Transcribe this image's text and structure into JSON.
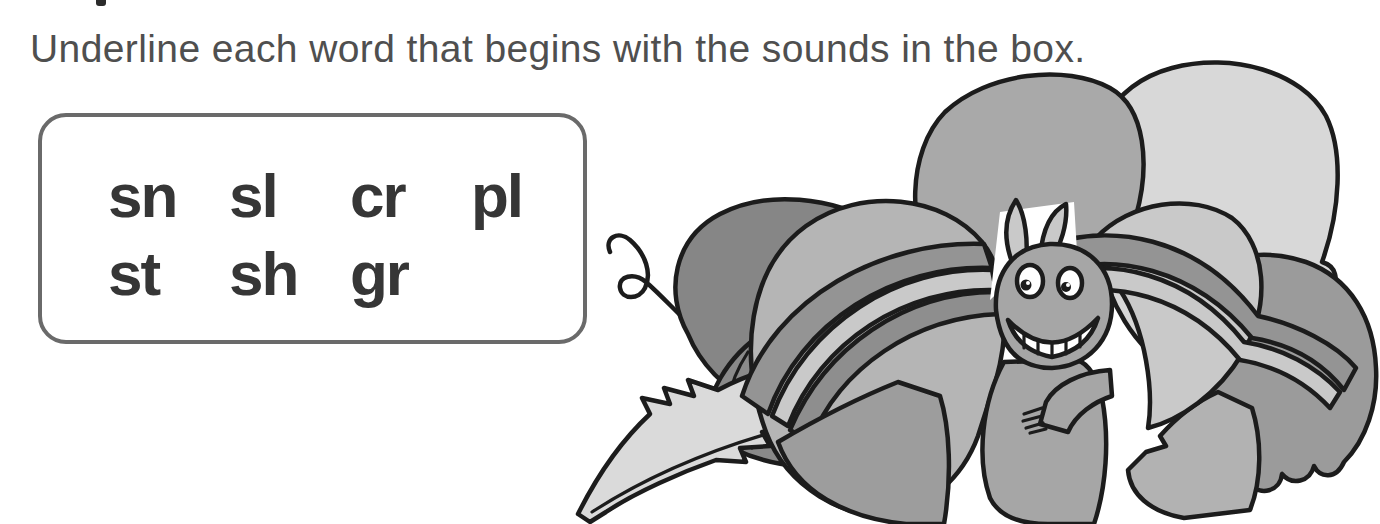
{
  "instruction": "Underline each word that begins with the sounds in the box.",
  "sounds_box": {
    "row1": [
      "sn",
      "sl",
      "cr",
      "pl"
    ],
    "row2": [
      "st",
      "sh",
      "gr"
    ]
  },
  "illustration": {
    "description": "smiling caterpillar resting in a pile of bundled leaves",
    "palette": {
      "white": "#ffffff",
      "back_leaf": "#868686",
      "tail_dark": "#8a8a8a",
      "tail_light": "#dadada",
      "top_light": "#d8d8d8",
      "cap": "#a9a9a9",
      "hanging": "#c9c9c9",
      "bundle": "#b5b5b5",
      "right_big": "#9b9b9b",
      "bottom_right": "#b2b2b2",
      "mass": "#9d9d9d",
      "rope_dark": "#949494",
      "rope_mid": "#8e8e8e",
      "rope_light": "#c9c9c9",
      "creature": "#a6a6a6",
      "antenna": "#c9c9c9",
      "pupil": "#1c1c1c"
    }
  },
  "colors": {
    "page_bg": "#ffffff",
    "instruction_text": "#4f4f4f",
    "box_border": "#6a6a6a",
    "sound_letters": "#363636",
    "outline": "#1c1c1c"
  }
}
